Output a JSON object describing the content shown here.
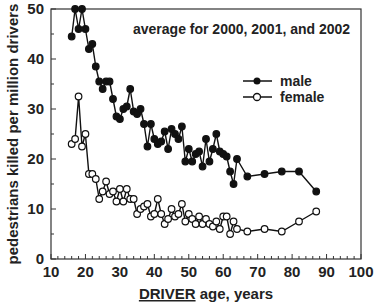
{
  "chart_data": {
    "type": "line",
    "title": "",
    "annotation": "average for 2000, 2001, and 2002",
    "xlabel_underlined": "DRIVER",
    "xlabel_rest": " age, years",
    "ylabel": "pedestrians killed per million drivers",
    "xlim": [
      10,
      100
    ],
    "ylim": [
      0,
      50
    ],
    "xticks": [
      10,
      20,
      30,
      40,
      50,
      60,
      70,
      80,
      90,
      100
    ],
    "yticks": [
      0,
      10,
      20,
      30,
      40,
      50
    ],
    "grid": false,
    "legend_position": "upper right",
    "series": [
      {
        "name": "male",
        "marker": "filled-circle",
        "x": [
          16,
          17,
          18,
          19,
          20,
          21,
          22,
          23,
          24,
          25,
          26,
          27,
          28,
          29,
          30,
          31,
          32,
          33,
          34,
          35,
          36,
          37,
          38,
          39,
          40,
          41,
          42,
          43,
          44,
          45,
          46,
          47,
          48,
          49,
          50,
          51,
          52,
          53,
          54,
          55,
          56,
          57,
          58,
          59,
          60,
          61,
          62,
          63,
          64,
          67,
          72,
          77,
          82,
          87
        ],
        "y": [
          44.5,
          50,
          46,
          50,
          46,
          42,
          43,
          38.5,
          35.5,
          34,
          35.5,
          35.5,
          32,
          28.5,
          28,
          30,
          30.5,
          34,
          29.5,
          29,
          30,
          27,
          22.5,
          27,
          24,
          23,
          23.5,
          25.5,
          22,
          26,
          25,
          24,
          26.5,
          19.5,
          22,
          19.5,
          21,
          21.5,
          18.5,
          24,
          19.5,
          22,
          25,
          21.5,
          21,
          20.5,
          17.5,
          15,
          20,
          16.5,
          17,
          17.5,
          17.5,
          13.5
        ]
      },
      {
        "name": "female",
        "marker": "open-circle",
        "x": [
          16,
          17,
          18,
          19,
          20,
          21,
          22,
          23,
          24,
          25,
          26,
          27,
          28,
          29,
          30,
          31,
          32,
          33,
          34,
          35,
          36,
          37,
          38,
          39,
          40,
          41,
          42,
          43,
          44,
          45,
          46,
          47,
          48,
          49,
          50,
          51,
          52,
          53,
          54,
          55,
          56,
          57,
          58,
          59,
          60,
          61,
          62,
          63,
          64,
          67,
          72,
          77,
          82,
          87
        ],
        "y": [
          23,
          24,
          32.5,
          22.5,
          25,
          17,
          17,
          16,
          12,
          13.5,
          15.5,
          13,
          13.5,
          11.5,
          14,
          11.5,
          14,
          12,
          12,
          9,
          10,
          10.5,
          11,
          8.5,
          9,
          12,
          9,
          7,
          8,
          10,
          8.5,
          9,
          11,
          7.5,
          9,
          8,
          7,
          8.5,
          7,
          8,
          7,
          6.5,
          7.5,
          6,
          8.5,
          8.5,
          5,
          7.5,
          6,
          5.5,
          6,
          5.5,
          7.5,
          9.5
        ]
      }
    ]
  },
  "legend": {
    "male": "male",
    "female": "female"
  },
  "colors": {
    "line": "#111111",
    "axis": "#222222"
  }
}
